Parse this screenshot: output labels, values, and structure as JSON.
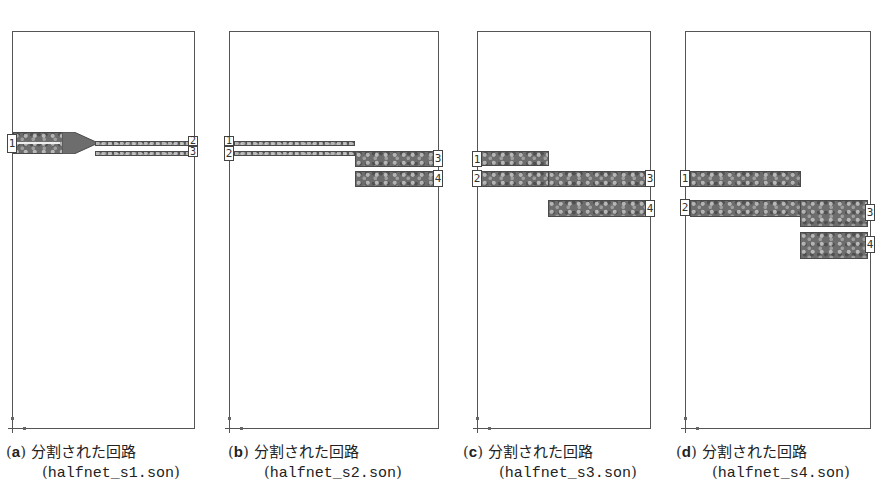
{
  "panels": [
    {
      "id": "a",
      "caption": {
        "open_paren": "(",
        "letter": "a",
        "close_paren": ")",
        "title": "分割された回路",
        "file_open": "(",
        "file": "halfnet_s1.son",
        "file_close": ")"
      },
      "ports": [
        "1",
        "2",
        "3"
      ]
    },
    {
      "id": "b",
      "caption": {
        "open_paren": "(",
        "letter": "b",
        "close_paren": ")",
        "title": "分割された回路",
        "file_open": "(",
        "file": "halfnet_s2.son",
        "file_close": ")"
      },
      "ports": [
        "1",
        "2",
        "3",
        "4"
      ]
    },
    {
      "id": "c",
      "caption": {
        "open_paren": "(",
        "letter": "c",
        "close_paren": ")",
        "title": "分割された回路",
        "file_open": "(",
        "file": "halfnet_s3.son",
        "file_close": ")"
      },
      "ports": [
        "1",
        "2",
        "3",
        "4"
      ]
    },
    {
      "id": "d",
      "caption": {
        "open_paren": "(",
        "letter": "d",
        "close_paren": ")",
        "title": "分割された回路",
        "file_open": "(",
        "file": "halfnet_s4.son",
        "file_close": ")"
      },
      "ports": [
        "1",
        "2",
        "3",
        "4"
      ]
    }
  ],
  "colors": {
    "trace_fill": "#6d6d6d",
    "frame": "#555555",
    "background": "#ffffff"
  }
}
